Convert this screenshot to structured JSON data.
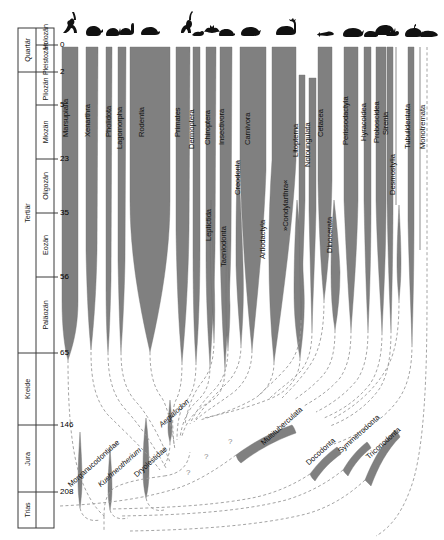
{
  "figure": {
    "type": "phylogenetic-spindle-diagram",
    "width": 444,
    "height": 540,
    "colors": {
      "spindle_fill": "#808080",
      "spindle_stroke": "#6e6e6e",
      "dashed_line": "#9a9a9a",
      "frame": "#3a3a3a",
      "text": "#111111",
      "background": "#ffffff"
    }
  },
  "timescale": {
    "column_headers": [
      "era",
      "period"
    ],
    "eras": [
      {
        "name": "Quartär",
        "top": 28,
        "bottom": 72
      },
      {
        "name": "Tertiär",
        "top": 72,
        "bottom": 353
      },
      {
        "name": "Kreide",
        "top": 353,
        "bottom": 425
      },
      {
        "name": "Jura",
        "top": 425,
        "bottom": 492
      },
      {
        "name": "Trias",
        "top": 492,
        "bottom": 528
      }
    ],
    "epochs": [
      {
        "name": "Holozän",
        "top": 28,
        "bottom": 45
      },
      {
        "name": "Pleistozän",
        "top": 45,
        "bottom": 72
      },
      {
        "name": "Pliozän",
        "top": 72,
        "bottom": 105
      },
      {
        "name": "Miozän",
        "top": 105,
        "bottom": 159
      },
      {
        "name": "Oligozän",
        "top": 159,
        "bottom": 213
      },
      {
        "name": "Eozän",
        "top": 213,
        "bottom": 277
      },
      {
        "name": "Paläozän",
        "top": 277,
        "bottom": 353
      }
    ],
    "ticks": [
      {
        "value": "0",
        "y": 45
      },
      {
        "value": "2",
        "y": 72
      },
      {
        "value": "5",
        "y": 105
      },
      {
        "value": "23",
        "y": 159
      },
      {
        "value": "35",
        "y": 213
      },
      {
        "value": "56",
        "y": 277
      },
      {
        "value": "65",
        "y": 353
      },
      {
        "value": "146",
        "y": 425
      },
      {
        "value": "208",
        "y": 492
      }
    ],
    "unit_note": "Millionen Jahre"
  },
  "taxa": [
    {
      "name": "Marsupialia",
      "x": 70,
      "y": 128,
      "icon": "kangaroo-silhouette",
      "italic": false
    },
    {
      "name": "Xenarthra",
      "x": 92,
      "y": 128,
      "icon": "armadillo-silhouette",
      "italic": false
    },
    {
      "name": "Pholidota",
      "x": 113,
      "y": 128,
      "icon": "pangolin-silhouette",
      "italic": false
    },
    {
      "name": "Lagomorpha",
      "x": 124,
      "y": 140,
      "icon": "rabbit-silhouette",
      "italic": false
    },
    {
      "name": "Rodentia",
      "x": 146,
      "y": 128,
      "icon": "rodent-silhouette",
      "italic": false
    },
    {
      "name": "Primates",
      "x": 182,
      "y": 128,
      "icon": "primate-silhouette",
      "italic": false
    },
    {
      "name": "Dermoptera",
      "x": 196,
      "y": 140,
      "icon": "colugo-silhouette",
      "italic": false
    },
    {
      "name": "Chiroptera",
      "x": 212,
      "y": 136,
      "icon": "bat-silhouette",
      "italic": false
    },
    {
      "name": "Insectivora",
      "x": 226,
      "y": 136,
      "icon": "shrew-silhouette",
      "italic": false
    },
    {
      "name": "Carnivora",
      "x": 252,
      "y": 136,
      "icon": "carnivore-silhouette",
      "italic": false
    },
    {
      "name": "Leptictida",
      "x": 213,
      "y": 232,
      "icon": null,
      "italic": false
    },
    {
      "name": "Taeniodonta",
      "x": 228,
      "y": 258,
      "icon": null,
      "italic": false
    },
    {
      "name": "Creodonta",
      "x": 242,
      "y": 186,
      "icon": null,
      "italic": false
    },
    {
      "name": "Artiodactyla",
      "x": 267,
      "y": 250,
      "icon": "ungulate-silhouette",
      "italic": false
    },
    {
      "name": "»Condylarthra«",
      "x": 290,
      "y": 222,
      "icon": null,
      "italic": false
    },
    {
      "name": "Litopterna",
      "x": 300,
      "y": 148,
      "icon": null,
      "italic": false
    },
    {
      "name": "Notoungulata",
      "x": 312,
      "y": 158,
      "icon": null,
      "italic": false
    },
    {
      "name": "Cetacea",
      "x": 325,
      "y": 128,
      "icon": "whale-silhouette",
      "italic": false
    },
    {
      "name": "Dinocerata",
      "x": 334,
      "y": 244,
      "icon": null,
      "italic": false
    },
    {
      "name": "Perissodactyla",
      "x": 350,
      "y": 136,
      "icon": "rhino-silhouette",
      "italic": false
    },
    {
      "name": "Hyracoidea",
      "x": 368,
      "y": 132,
      "icon": "hyrax-silhouette",
      "italic": false
    },
    {
      "name": "Proboscidea",
      "x": 381,
      "y": 134,
      "icon": "elephant-silhouette",
      "italic": false
    },
    {
      "name": "Sirenia",
      "x": 390,
      "y": 126,
      "icon": "manatee-silhouette",
      "italic": false
    },
    {
      "name": "Desmostylia",
      "x": 397,
      "y": 186,
      "icon": null,
      "italic": false
    },
    {
      "name": "Tubulidentata",
      "x": 412,
      "y": 140,
      "icon": "aardvark-silhouette",
      "italic": false
    },
    {
      "name": "Monotremata",
      "x": 427,
      "y": 140,
      "icon": "platypus-silhouette",
      "italic": false
    },
    {
      "name": "Aegialodon",
      "x": 163,
      "y": 420,
      "icon": null,
      "italic": true
    },
    {
      "name": "Morganucodontidae",
      "x": 72,
      "y": 480,
      "icon": null,
      "italic": false
    },
    {
      "name": "Kuehneotherium",
      "x": 102,
      "y": 480,
      "icon": null,
      "italic": true
    },
    {
      "name": "Dryolestidae",
      "x": 138,
      "y": 470,
      "icon": null,
      "italic": false
    },
    {
      "name": "Multituberculata",
      "x": 265,
      "y": 438,
      "icon": null,
      "italic": false
    },
    {
      "name": "Docodonta",
      "x": 310,
      "y": 458,
      "icon": null,
      "italic": false
    },
    {
      "name": "Symmetrodonta",
      "x": 342,
      "y": 446,
      "icon": null,
      "italic": false
    },
    {
      "name": "Triconodonta",
      "x": 370,
      "y": 452,
      "icon": null,
      "italic": false
    }
  ],
  "annotations": [
    {
      "symbol": "?",
      "x": 204,
      "y": 452
    },
    {
      "symbol": "?",
      "x": 228,
      "y": 437
    },
    {
      "symbol": "?",
      "x": 186,
      "y": 468
    }
  ]
}
